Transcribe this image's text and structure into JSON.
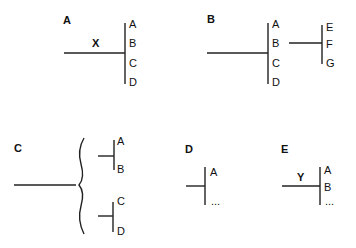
{
  "panels": {
    "a": {
      "label": "A",
      "edge_label": "X",
      "nodes": [
        "A",
        "B",
        "C",
        "D"
      ]
    },
    "b": {
      "label": "B",
      "nodes": [
        "A",
        "B",
        "C",
        "D"
      ],
      "sub_nodes": [
        "E",
        "F",
        "G"
      ]
    },
    "c": {
      "label": "C",
      "upper_nodes": [
        "A",
        "B"
      ],
      "lower_nodes": [
        "C",
        "D"
      ]
    },
    "d": {
      "label": "D",
      "nodes": [
        "A",
        "..."
      ]
    },
    "e": {
      "label": "E",
      "edge_label": "Y",
      "nodes": [
        "A",
        "B",
        "..."
      ]
    }
  },
  "colors": {
    "line": "#222222",
    "text": "#111111",
    "background": "#ffffff"
  }
}
